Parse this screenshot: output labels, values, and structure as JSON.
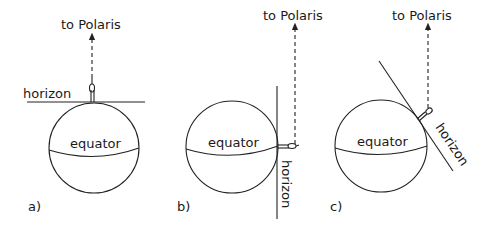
{
  "figure": {
    "panels": [
      {
        "id": "a",
        "label": "a)",
        "target_label": "to Polaris",
        "horizon_label": "horizon",
        "equator_label": "equator",
        "observer_location": "north pole",
        "horizon_orientation": "horizontal"
      },
      {
        "id": "b",
        "label": "b)",
        "target_label": "to Polaris",
        "horizon_label": "horizon",
        "equator_label": "equator",
        "observer_location": "equator",
        "horizon_orientation": "vertical"
      },
      {
        "id": "c",
        "label": "c)",
        "target_label": "to Polaris",
        "horizon_label": "horizon",
        "equator_label": "equator",
        "observer_location": "mid-latitude",
        "horizon_orientation": "tilted"
      }
    ],
    "colors": {
      "ink": "#222222",
      "background": "#ffffff"
    }
  }
}
